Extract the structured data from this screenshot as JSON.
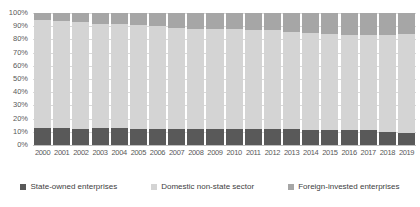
{
  "chart_data": {
    "type": "bar",
    "subtype": "stacked-100-percent",
    "title": "",
    "xlabel": "",
    "ylabel": "",
    "ylim": [
      0,
      100
    ],
    "ytick_labels": [
      "100%",
      "90%",
      "80%",
      "70%",
      "60%",
      "50%",
      "40%",
      "30%",
      "20%",
      "10%",
      "0%"
    ],
    "ytick_values": [
      100,
      90,
      80,
      70,
      60,
      50,
      40,
      30,
      20,
      10,
      0
    ],
    "grid": true,
    "legend_position": "bottom",
    "categories": [
      "2000",
      "2001",
      "2002",
      "2003",
      "2004",
      "2005",
      "2006",
      "2007",
      "2008",
      "2009",
      "2010",
      "2011",
      "2012",
      "2013",
      "2014",
      "2015",
      "2016",
      "2017",
      "2018",
      "2019"
    ],
    "series": [
      {
        "name": "State-owned enterprises",
        "color": "#595959",
        "values": [
          13,
          13,
          12,
          13,
          13,
          12,
          12,
          12,
          12,
          12,
          12,
          12,
          12,
          12,
          11,
          11,
          11,
          11,
          10,
          9
        ]
      },
      {
        "name": "Domestic non-state sector",
        "color": "#d4d4d4",
        "values": [
          82,
          81,
          81,
          79,
          79,
          79,
          78,
          77,
          76,
          76,
          76,
          75,
          75,
          74,
          74,
          73,
          72,
          72,
          73,
          75
        ]
      },
      {
        "name": "Foreign-invested enterprises",
        "color": "#a6a6a6",
        "values": [
          5,
          6,
          7,
          8,
          8,
          9,
          10,
          11,
          12,
          12,
          12,
          13,
          13,
          14,
          15,
          16,
          17,
          17,
          17,
          16
        ]
      }
    ]
  },
  "legend": {
    "items": [
      {
        "label": "State-owned enterprises",
        "color": "#595959",
        "swatch_icon": "square-swatch-icon"
      },
      {
        "label": "Domestic non-state sector",
        "color": "#d4d4d4",
        "swatch_icon": "square-swatch-icon"
      },
      {
        "label": "Foreign-invested enterprises",
        "color": "#a6a6a6",
        "swatch_icon": "square-swatch-icon"
      }
    ]
  }
}
